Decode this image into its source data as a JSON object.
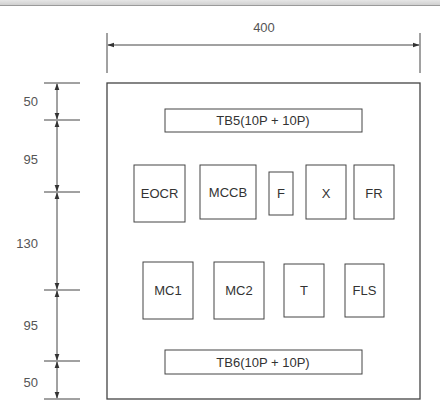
{
  "diagram": {
    "width_dimension": "400",
    "height_dimensions": [
      "50",
      "95",
      "130",
      "95",
      "50"
    ],
    "terminal_blocks": {
      "top": "TB5(10P + 10P)",
      "bottom": "TB6(10P + 10P)"
    },
    "row1_components": [
      "EOCR",
      "MCCB",
      "F",
      "X",
      "FR"
    ],
    "row2_components": [
      "MC1",
      "MC2",
      "T",
      "FLS"
    ],
    "colors": {
      "line": "#333333",
      "text": "#333333",
      "dim_text": "#555555"
    }
  }
}
